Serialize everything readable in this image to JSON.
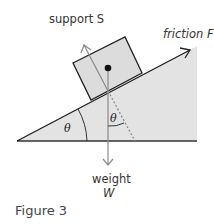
{
  "figure": {
    "caption": "Figure 3",
    "labels": {
      "support": "support S",
      "friction": "friction F",
      "weight": "weight",
      "weight_symbol": "W",
      "angle_base": "θ",
      "angle_inner": "θ"
    },
    "colors": {
      "slope_fill": "#e3e3e3",
      "box_fill": "#dcdcdc",
      "line": "#222222",
      "force_arrow": "#8a8a8a",
      "dashed": "#8a8a8a"
    }
  }
}
